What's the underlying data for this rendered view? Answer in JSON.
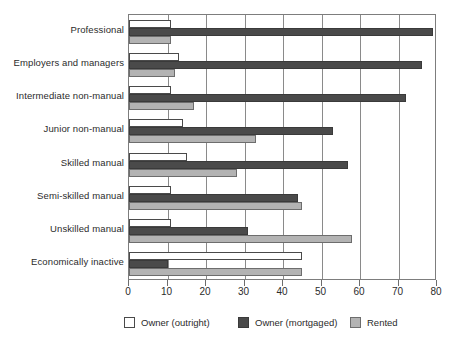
{
  "chart_data": {
    "type": "bar",
    "orientation": "horizontal",
    "title": "",
    "xlabel": "",
    "ylabel": "",
    "xlim": [
      0,
      80
    ],
    "xticks": [
      0,
      10,
      20,
      30,
      40,
      50,
      60,
      70,
      80
    ],
    "grid": true,
    "legend_position": "bottom",
    "categories": [
      "Professional",
      "Employers and managers",
      "Intermediate non-manual",
      "Junior non-manual",
      "Skilled manual",
      "Semi-skilled manual",
      "Unskilled manual",
      "Economically inactive"
    ],
    "series": [
      {
        "name": "Owner (outright)",
        "color": "#ffffff",
        "values": [
          11,
          13,
          11,
          14,
          15,
          11,
          11,
          45
        ]
      },
      {
        "name": "Owner (mortgaged)",
        "color": "#4a4a4a",
        "values": [
          79,
          76,
          72,
          53,
          57,
          44,
          31,
          10
        ]
      },
      {
        "name": "Rented",
        "color": "#b3b3b3",
        "values": [
          11,
          12,
          17,
          33,
          28,
          45,
          58,
          45
        ]
      }
    ]
  },
  "legend": {
    "items": [
      {
        "label": "Owner (outright)",
        "swatch": "outright"
      },
      {
        "label": "Owner (mortgaged)",
        "swatch": "mortgaged"
      },
      {
        "label": "Rented",
        "swatch": "rented"
      }
    ]
  },
  "caption": ""
}
